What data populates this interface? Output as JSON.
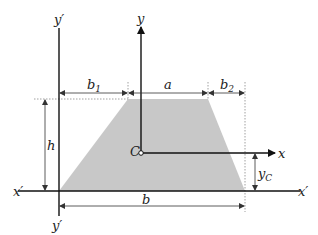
{
  "diagram": {
    "colors": {
      "fill": "#c8c8c8",
      "axis": "#222222",
      "dim": "#333333",
      "guide": "#888888"
    },
    "labels": {
      "y_prime_top": "y′",
      "y_prime_bottom": "y′",
      "y": "y",
      "x": "x",
      "x_prime_left": "x′",
      "x_prime_right": "x′",
      "b1": "b",
      "b1_sub": "1",
      "a": "a",
      "b2": "b",
      "b2_sub": "2",
      "h": "h",
      "C": "C",
      "yC": "y",
      "yC_sub": "C",
      "b": "b"
    },
    "shape": {
      "type": "trapezoid",
      "bottom_left": [
        59,
        191
      ],
      "bottom_right": [
        245,
        191
      ],
      "top_right": [
        208,
        99
      ],
      "top_left": [
        128,
        99
      ]
    },
    "centroid": [
      141,
      153
    ]
  }
}
